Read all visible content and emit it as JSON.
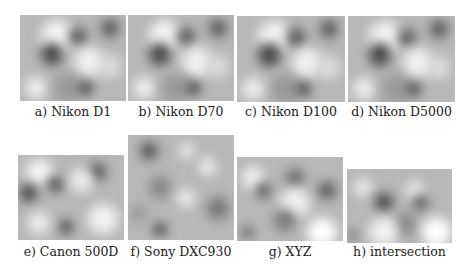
{
  "figure": {
    "panels": [
      {
        "id": "a",
        "label": "a) Nikon D1",
        "box": [
          20,
          15,
          106,
          86
        ],
        "cap_y": 104,
        "style": "std"
      },
      {
        "id": "b",
        "label": "b) Nikon D70",
        "box": [
          128,
          15,
          106,
          86
        ],
        "cap_y": 104,
        "style": "std"
      },
      {
        "id": "c",
        "label": "c) Nikon D100",
        "box": [
          237,
          16,
          108,
          86
        ],
        "cap_y": 104,
        "style": "std"
      },
      {
        "id": "d",
        "label": "d) Nikon D5000",
        "box": [
          348,
          16,
          107,
          86
        ],
        "cap_y": 104,
        "style": "std"
      },
      {
        "id": "e",
        "label": "e) Canon 500D",
        "box": [
          18,
          155,
          106,
          85
        ],
        "cap_y": 244,
        "style": "canon"
      },
      {
        "id": "f",
        "label": "f) Sony DXC930",
        "box": [
          128,
          135,
          106,
          105
        ],
        "cap_y": 244,
        "style": "sony"
      },
      {
        "id": "g",
        "label": "g) XYZ",
        "box": [
          237,
          157,
          106,
          84
        ],
        "cap_y": 244,
        "style": "xyz"
      },
      {
        "id": "h",
        "label": "h) intersection",
        "box": [
          347,
          169,
          105,
          74
        ],
        "cap_y": 244,
        "style": "inter"
      }
    ]
  }
}
